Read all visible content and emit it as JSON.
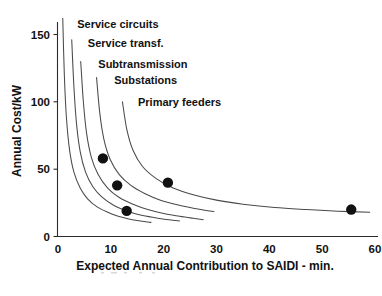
{
  "chart_data": {
    "type": "line",
    "title": "",
    "subtitle": "",
    "xlabel": "Expected Annual Contribution to SAIDI - min.",
    "ylabel": "Annual Cost/kW",
    "xlim": [
      0,
      60
    ],
    "ylim": [
      0,
      160
    ],
    "xticks": [
      0,
      10,
      20,
      30,
      40,
      50,
      60
    ],
    "yticks": [
      0,
      50,
      100,
      150
    ],
    "xtick_labels": [
      "0",
      "10",
      "20",
      "30",
      "40",
      "50",
      "60"
    ],
    "ytick_labels": [
      "0",
      "50",
      "100",
      "150"
    ],
    "grid": false,
    "legend_position": "inline-annotations",
    "series": [
      {
        "name": "Service circuits",
        "label": "Service circuits",
        "annotation_xy": [
          2.5,
          158
        ],
        "points": [
          [
            0.9,
            162
          ],
          [
            1.2,
            120
          ],
          [
            1.6,
            88
          ],
          [
            2.2,
            64
          ],
          [
            3.0,
            48
          ],
          [
            4.2,
            36
          ],
          [
            5.6,
            28
          ],
          [
            7.4,
            22
          ],
          [
            9.4,
            18
          ],
          [
            11.4,
            15
          ],
          [
            13.4,
            13
          ],
          [
            15.6,
            11.5
          ],
          [
            17.6,
            10.5
          ]
        ]
      },
      {
        "name": "Service transf.",
        "label": "Service transf.",
        "annotation_xy": [
          4.5,
          144
        ],
        "points": [
          [
            2.6,
            146
          ],
          [
            3.0,
            112
          ],
          [
            3.5,
            84
          ],
          [
            4.2,
            63
          ],
          [
            5.2,
            48
          ],
          [
            6.6,
            37
          ],
          [
            8.4,
            29
          ],
          [
            10.6,
            23
          ],
          [
            13.0,
            19
          ],
          [
            15.6,
            16
          ],
          [
            18.4,
            14
          ],
          [
            21.0,
            12.5
          ],
          [
            23.0,
            11.5
          ]
        ]
      },
      {
        "name": "Subtransmission",
        "label": "Subtransmission",
        "annotation_xy": [
          6.5,
          128
        ],
        "points": [
          [
            4.3,
            130
          ],
          [
            4.8,
            100
          ],
          [
            5.4,
            77
          ],
          [
            6.3,
            59
          ],
          [
            7.6,
            46
          ],
          [
            9.4,
            36
          ],
          [
            11.6,
            29
          ],
          [
            14.2,
            24
          ],
          [
            17.0,
            20
          ],
          [
            20.0,
            17
          ],
          [
            23.0,
            15
          ],
          [
            25.6,
            13.5
          ],
          [
            27.5,
            12.5
          ]
        ]
      },
      {
        "name": "Substations",
        "label": "Substations",
        "annotation_xy": [
          9.5,
          116
        ],
        "points": [
          [
            7.3,
            118
          ],
          [
            7.9,
            92
          ],
          [
            8.7,
            72
          ],
          [
            9.9,
            57
          ],
          [
            11.6,
            46
          ],
          [
            13.8,
            38
          ],
          [
            16.4,
            32
          ],
          [
            19.4,
            27
          ],
          [
            22.6,
            23.5
          ],
          [
            25.6,
            21
          ],
          [
            27.8,
            19.5
          ],
          [
            29.5,
            18.5
          ]
        ]
      },
      {
        "name": "Primary feeders",
        "label": "Primary feeders",
        "annotation_xy": [
          14.0,
          100
        ],
        "points": [
          [
            12.2,
            100
          ],
          [
            13.0,
            80
          ],
          [
            14.2,
            64
          ],
          [
            16.0,
            52
          ],
          [
            18.6,
            43
          ],
          [
            21.8,
            36
          ],
          [
            25.6,
            31
          ],
          [
            30.0,
            27
          ],
          [
            35.0,
            24
          ],
          [
            41.0,
            21.5
          ],
          [
            47.0,
            20
          ],
          [
            53.0,
            18.8
          ],
          [
            59.0,
            18
          ]
        ]
      }
    ],
    "markers": {
      "name": "optimum operating points",
      "style": "filled-circle",
      "color": "#111111",
      "points": [
        {
          "x": 8.5,
          "y": 58,
          "series": "Service circuits"
        },
        {
          "x": 11.2,
          "y": 38,
          "series": "Service transf."
        },
        {
          "x": 13.0,
          "y": 19,
          "series": "Subtransmission"
        },
        {
          "x": 20.8,
          "y": 40,
          "series": "Substations"
        },
        {
          "x": 55.5,
          "y": 20,
          "series": "Primary feeders"
        }
      ]
    }
  }
}
